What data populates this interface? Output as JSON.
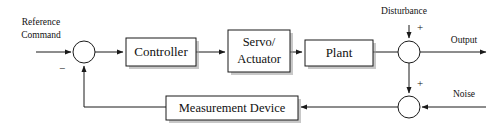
{
  "diagram": {
    "type": "control-block-diagram",
    "background_color": "#ffffff",
    "line_color": "#1a1a1a",
    "text_color": "#111111",
    "blocks": [
      {
        "id": "controller",
        "label": "Controller",
        "x": 126,
        "y": 38,
        "w": 70,
        "h": 28
      },
      {
        "id": "servo",
        "label_line1": "Servo/",
        "label_line2": "Actuator",
        "x": 228,
        "y": 30,
        "w": 62,
        "h": 42
      },
      {
        "id": "plant",
        "label": "Plant",
        "x": 305,
        "y": 40,
        "w": 68,
        "h": 26
      },
      {
        "id": "measurement",
        "label": "Measurement Device",
        "x": 166,
        "y": 96,
        "w": 132,
        "h": 24
      }
    ],
    "junctions": [
      {
        "id": "error-sum",
        "cx": 84,
        "cy": 52,
        "r": 11,
        "sign": "−"
      },
      {
        "id": "disturbance-sum",
        "cx": 409,
        "cy": 52,
        "r": 11,
        "sign": "+"
      },
      {
        "id": "noise-sum",
        "cx": 409,
        "cy": 107,
        "r": 11,
        "sign": "+"
      }
    ],
    "labels": {
      "reference_line1": "Reference",
      "reference_line2": "Command",
      "disturbance": "Disturbance",
      "output": "Output",
      "noise": "Noise",
      "minus_sign": "−",
      "plus_sign_disturbance": "+",
      "plus_sign_noise": "+"
    }
  }
}
